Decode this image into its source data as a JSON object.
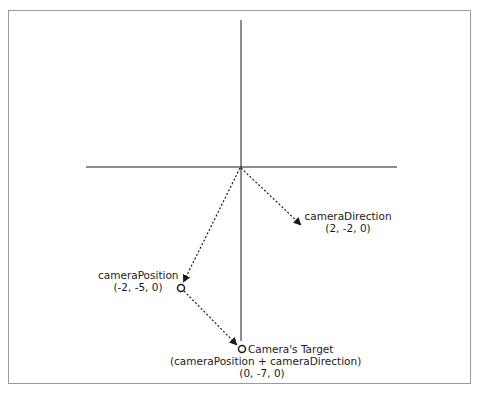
{
  "diagram": {
    "type": "coordinate-vector-diagram",
    "colors": {
      "frame": "#9a9a9a",
      "axis": "#1a1a1a",
      "arrow": "#1a1a1a",
      "text": "#1a1a1a"
    },
    "axes": {
      "origin": [
        0,
        0
      ],
      "horizontal": "x-axis",
      "vertical": "y-axis"
    },
    "vectors": [
      {
        "id": "cameraDirection",
        "label": "cameraDirection",
        "coords": "(2, -2, 0)",
        "from": "origin",
        "to": [
          2,
          -2,
          0
        ],
        "style": "dotted-arrow"
      },
      {
        "id": "cameraPosition",
        "label": "cameraPosition",
        "coords": "(-2, -5, 0)",
        "from": "origin",
        "to": [
          -2,
          -5,
          0
        ],
        "style": "dotted-arrow"
      },
      {
        "id": "positionToTarget",
        "from": [
          -2,
          -5,
          0
        ],
        "to": [
          0,
          -7,
          0
        ],
        "style": "dotted-arrow"
      }
    ],
    "points": [
      {
        "id": "cameraPosition",
        "label": "cameraPosition",
        "coords": "(-2, -5, 0)",
        "marker": "open-circle"
      },
      {
        "id": "cameraTarget",
        "title": "Camera's Target",
        "formula": "(cameraPosition + cameraDirection)",
        "coords": "(0, -7, 0)",
        "marker": "open-circle"
      }
    ]
  },
  "labels": {
    "direction_name": "cameraDirection",
    "direction_coords": "(2, -2, 0)",
    "position_name": "cameraPosition",
    "position_coords": "(-2, -5, 0)",
    "target_title": "Camera's Target",
    "target_formula": "(cameraPosition + cameraDirection)",
    "target_coords": "(0, -7, 0)"
  }
}
